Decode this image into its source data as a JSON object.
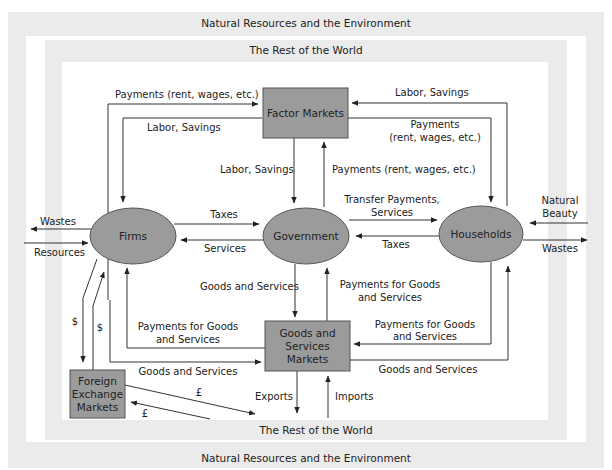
{
  "colors": {
    "frame_band": "#ebebeb",
    "node_fill": "#9b9b9b",
    "node_stroke": "#555555",
    "line": "#333333",
    "text": "#222222"
  },
  "frames": {
    "outer_top": "Natural Resources and the Environment",
    "inner_top": "The Rest of the World",
    "inner_bottom": "The Rest of the World",
    "outer_bottom": "Natural Resources and the Environment"
  },
  "nodes": {
    "factor_markets": "Factor Markets",
    "firms": "Firms",
    "government": "Government",
    "households": "Households",
    "goods_services_markets": [
      "Goods and",
      "Services",
      "Markets"
    ],
    "foreign_exchange_markets": [
      "Foreign",
      "Exchange",
      "Markets"
    ]
  },
  "flows": {
    "firms_to_factor_payments": "Payments (rent, wages, etc.)",
    "factor_to_firms_labor": "Labor, Savings",
    "households_to_factor_labor": "Labor, Savings",
    "factor_to_households_payments": [
      "Payments",
      "(rent, wages, etc.)"
    ],
    "factor_to_gov_labor": "Labor, Savings",
    "gov_to_factor_payments": "Payments (rent, wages, etc.)",
    "gov_to_households_transfer": [
      "Transfer Payments,",
      "Services"
    ],
    "households_to_gov_taxes": "Taxes",
    "firms_to_gov_taxes": "Taxes",
    "gov_to_firms_services": "Services",
    "firms_wastes": "Wastes",
    "firms_resources": "Resources",
    "households_natural_beauty": [
      "Natural",
      "Beauty"
    ],
    "households_wastes": "Wastes",
    "gsm_to_gov_goods": "Goods and Services",
    "gov_to_gsm_payments": [
      "Payments for Goods",
      "and Services"
    ],
    "gsm_to_firms_payments": [
      "Payments for Goods",
      "and Services"
    ],
    "firms_to_gsm_goods": "Goods and Services",
    "households_to_gsm_payments": [
      "Payments for Goods",
      "and Services"
    ],
    "gsm_to_households_goods": "Goods and Services",
    "firms_to_fx_dollar": "$",
    "fx_to_firms_dollar": "$",
    "fx_to_world_pound": "£",
    "world_to_fx_pound": "£",
    "exports": "Exports",
    "imports": "Imports"
  }
}
